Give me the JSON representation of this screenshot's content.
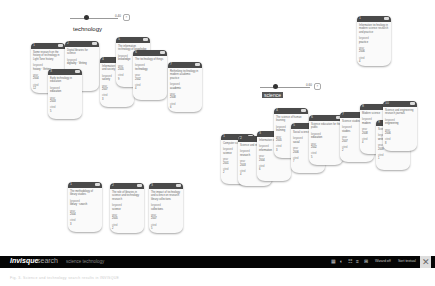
{
  "app": {
    "brand_bold": "Invisque",
    "brand_light": "search",
    "query": "science technology",
    "toolbar": {
      "icons": [
        "grid-icon",
        "pie-icon",
        "sort-icon",
        "list-icon",
        "filter-icon"
      ],
      "icon_glyphs": [
        "▦",
        "◐",
        "☷",
        "≡",
        "⊞"
      ],
      "buttons": [
        "Wizard off",
        "Sort textual"
      ],
      "logo_glyph": "✕"
    },
    "caption": "Fig. 3. Science and technology search results in INVISQUE"
  },
  "clusters": [
    {
      "label": "technology",
      "highlighted": false,
      "slider": {
        "value_label": "0.40",
        "close": "×"
      },
      "cards": [
        {
          "num": "1",
          "title": "Some research on the history of technology in Light Tone history",
          "k1": "keyword",
          "v1": "history  ·  Vetting",
          "k2": "year",
          "v2": "2004",
          "k3": "cited",
          "v3": "12"
        },
        {
          "num": "2",
          "title": "Digital libraries for science",
          "k1": "keyword",
          "v1": "digitality  ·  Vetting",
          "k2": "year",
          "v2": "2006",
          "k3": "cited",
          "v3": "8"
        },
        {
          "num": "3",
          "title": "Early technology in education",
          "k1": "keyword",
          "v1": "education",
          "k2": "year",
          "v2": "2003",
          "k3": "cited",
          "v3": "5"
        },
        {
          "num": "4",
          "title": "Information technology and society",
          "k1": "keyword",
          "v1": "society",
          "k2": "year",
          "v2": "2007",
          "k3": "cited",
          "v3": "3"
        },
        {
          "num": "5",
          "title": "The information technology of knowledge",
          "k1": "keyword",
          "v1": "knowledge",
          "k2": "year",
          "v2": "2005",
          "k3": "cited",
          "v3": "9"
        },
        {
          "num": "6",
          "title": "The technology of things",
          "k1": "keyword",
          "v1": "technology",
          "k2": "year",
          "v2": "2002",
          "k3": "cited",
          "v3": "4"
        },
        {
          "num": "7",
          "title": "Rethinking technology in modern academic practice",
          "k1": "keyword",
          "v1": "academic",
          "k2": "year",
          "v2": "2008",
          "k3": "cited",
          "v3": "6"
        }
      ]
    },
    {
      "label": "science",
      "highlighted": true,
      "slider": {
        "value_label": "0.60",
        "close": "×"
      },
      "cards": [
        {
          "num": "1",
          "title": "Computer science",
          "k1": "keyword",
          "v1": "science",
          "k2": "year",
          "v2": "2001",
          "k3": "cited",
          "v3": "2"
        },
        {
          "num": "2",
          "title": "Science and research",
          "k1": "keyword",
          "v1": "research",
          "k2": "year",
          "v2": "2003",
          "k3": "cited",
          "v3": "4"
        },
        {
          "num": "3",
          "title": "Information science",
          "k1": "keyword",
          "v1": "information",
          "k2": "year",
          "v2": "2004",
          "k3": "cited",
          "v3": "6"
        },
        {
          "num": "4",
          "title": "The science of human learning",
          "k1": "keyword",
          "v1": "learning",
          "k2": "year",
          "v2": "2005",
          "k3": "cited",
          "v3": "3"
        },
        {
          "num": "5",
          "title": "Social science",
          "k1": "keyword",
          "v1": "social",
          "k2": "year",
          "v2": "2006",
          "k3": "cited",
          "v3": "7"
        },
        {
          "num": "6",
          "title": "Science education for the public",
          "k1": "keyword",
          "v1": "education",
          "k2": "year",
          "v2": "2002",
          "k3": "cited",
          "v3": "5"
        },
        {
          "num": "7",
          "title": "Science studies",
          "k1": "keyword",
          "v1": "studies",
          "k2": "year",
          "v2": "2007",
          "k3": "cited",
          "v3": "2"
        },
        {
          "num": "8",
          "title": "Modern science",
          "k1": "keyword",
          "v1": "modern",
          "k2": "year",
          "v2": "2008",
          "k3": "cited",
          "v3": "4"
        },
        {
          "num": "9",
          "title": "Science writing",
          "k1": "keyword",
          "v1": "writing",
          "k2": "year",
          "v2": "2009",
          "k3": "cited",
          "v3": "1"
        },
        {
          "num": "10",
          "title": "Science and engineering research journals",
          "k1": "keyword",
          "v1": "engineering",
          "k2": "year",
          "v2": "2006",
          "k3": "cited",
          "v3": "8"
        }
      ]
    },
    {
      "label": "",
      "cards": [
        {
          "num": "1",
          "title": "The methodology of library studies",
          "k1": "keyword",
          "v1": "library  ·  search",
          "k2": "year",
          "v2": "2004",
          "k3": "cited",
          "v3": "3"
        },
        {
          "num": "2",
          "title": "The role of libraries in science and technology research",
          "k1": "keyword",
          "v1": "science",
          "k2": "year",
          "v2": "2005",
          "k3": "cited",
          "v3": "2"
        },
        {
          "num": "3",
          "title": "The impact of technology and science on research library collections",
          "k1": "keyword",
          "v1": "collections",
          "k2": "year",
          "v2": "2007",
          "k3": "cited",
          "v3": "5"
        }
      ]
    },
    {
      "label": "",
      "cards": [
        {
          "num": "1",
          "title": "Information technology in modern science research and practice",
          "k1": "keyword",
          "v1": "practice",
          "k2": "year",
          "v2": "2006",
          "k3": "cited",
          "v3": "4"
        }
      ]
    }
  ]
}
